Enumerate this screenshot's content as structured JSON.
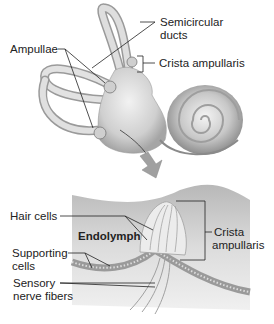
{
  "figure": {
    "top_panel": {
      "labels": {
        "semicircular_ducts_line1": "Semicircular",
        "semicircular_ducts_line2": "ducts",
        "ampullae": "Ampullae",
        "crista_ampullaris": "Crista ampullaris"
      }
    },
    "bottom_panel": {
      "labels": {
        "hair_cells": "Hair cells",
        "endolymph": "Endolymph",
        "crista_line1": "Crista",
        "crista_line2": "ampullaris",
        "supporting_line1": "Supporting",
        "supporting_line2": "cells",
        "sensory_line1": "Sensory",
        "sensory_line2": "nerve fibers"
      }
    },
    "colors": {
      "tissue_light": "#e6e6e6",
      "tissue_mid": "#bdbdbd",
      "tissue_dark": "#8a8a8a",
      "leader_line": "#222222",
      "arrow": "#9a9a9a"
    }
  }
}
